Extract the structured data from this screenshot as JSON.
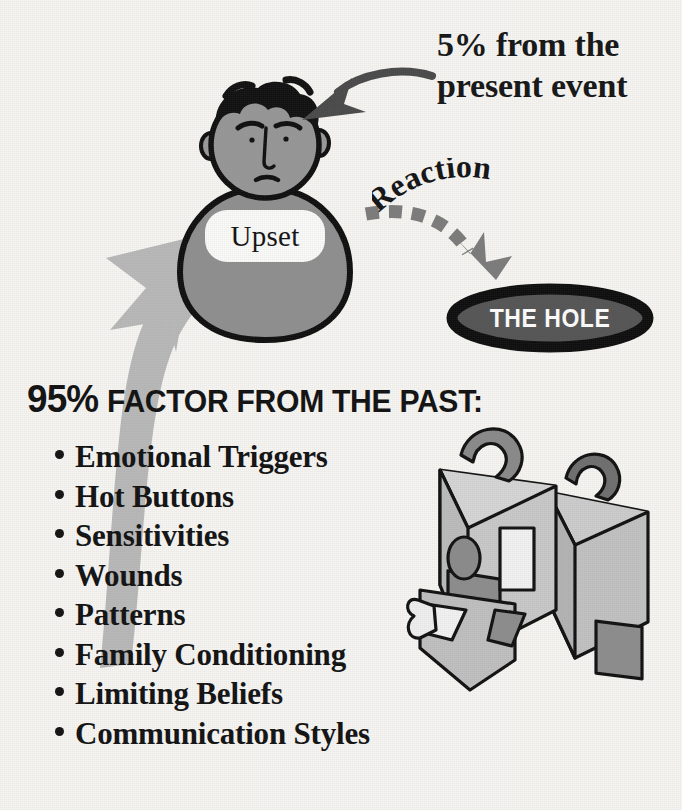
{
  "diagram": {
    "title": "95% Factor From The Past",
    "background_color": "#f7f6f3",
    "ink_color": "#111111"
  },
  "present_event": {
    "line1": "5% from the",
    "line2": "present event",
    "arrow_label": "curved-arrow-to-person"
  },
  "person": {
    "state_label": "Upset",
    "head_fill": "#8f8f8f",
    "body_fill": "#8f8f8f",
    "hair_fill": "#111111"
  },
  "reaction": {
    "label": "Reaction",
    "arrow_style": "dashed",
    "arrow_color": "#7c7c7c"
  },
  "hole": {
    "label": "THE HOLE",
    "fill": "#555555",
    "border": "#0d0d0d",
    "text_color": "#ffffff"
  },
  "past": {
    "percent": "95%",
    "heading": "FACTOR FROM THE PAST:",
    "items": [
      "Emotional Triggers",
      "Hot Buttons",
      "Sensitivities",
      "Wounds",
      "Patterns",
      "Family Conditioning",
      "Limiting Beliefs",
      "Communication Styles"
    ],
    "arrow_label": "big-gray-arrow-from-past-to-person",
    "arrow_color": "#b9b9b9"
  },
  "luggage": {
    "label": "two-suitcases-baggage",
    "front_fill": "#c9c9c9",
    "back_fill": "#c2c2c2",
    "accent_fill": "#8d8d8d"
  }
}
